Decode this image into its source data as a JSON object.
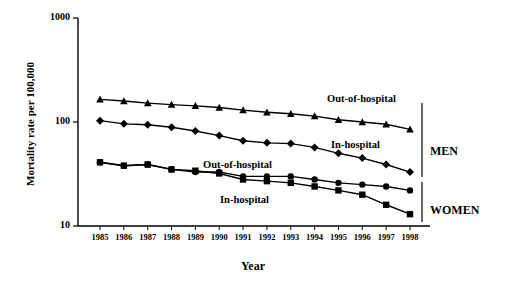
{
  "chart_data": {
    "type": "line",
    "title": "",
    "xlabel": "Year",
    "ylabel": "Mortality rate per 100,000",
    "yscale": "log",
    "ylim": [
      10,
      1000
    ],
    "ytick_labels": [
      "1000",
      "100",
      "10"
    ],
    "ytick_values": [
      1000,
      100,
      10
    ],
    "grid": false,
    "legend_position": "inline-annotations",
    "categories": [
      "1985",
      "1986",
      "1987",
      "1988",
      "1989",
      "1990",
      "1991",
      "1992",
      "1993",
      "1994",
      "1995",
      "1996",
      "1997",
      "1998"
    ],
    "series": [
      {
        "name": "Out-of-hospital",
        "group": "MEN",
        "marker": "triangle",
        "values": [
          165,
          159,
          152,
          147,
          143,
          138,
          130,
          124,
          120,
          114,
          105,
          100,
          95,
          85
        ]
      },
      {
        "name": "In-hospital",
        "group": "MEN",
        "marker": "diamond",
        "values": [
          103,
          96,
          94,
          89,
          82,
          74,
          66,
          63,
          62,
          57,
          50,
          45,
          39,
          33
        ]
      },
      {
        "name": "Out-of-hospital",
        "group": "WOMEN",
        "marker": "circle",
        "values": [
          41,
          38,
          39,
          35,
          33,
          33,
          30,
          30,
          30,
          28,
          26,
          25,
          24,
          22
        ]
      },
      {
        "name": "In-hospital",
        "group": "WOMEN",
        "marker": "square",
        "values": [
          41,
          38,
          39,
          35,
          34,
          32,
          28,
          27,
          26,
          24,
          22,
          20,
          16,
          13
        ]
      }
    ],
    "annotations": [
      {
        "text": "Out-of-hospital",
        "series": "MEN Out-of-hospital"
      },
      {
        "text": "In-hospital",
        "series": "MEN In-hospital"
      },
      {
        "text": "Out-of-hospital",
        "series": "WOMEN Out-of-hospital"
      },
      {
        "text": "In-hospital",
        "series": "WOMEN In-hospital"
      },
      {
        "text": "MEN",
        "type": "group-bracket"
      },
      {
        "text": "WOMEN",
        "type": "group-bracket"
      }
    ],
    "colors": {
      "line": "#000000",
      "marker": "#000000",
      "axis": "#000000",
      "background": "#ffffff"
    }
  },
  "labels": {
    "ylabel": "Mortality rate per 100,000",
    "xlabel": "Year",
    "y_ticks": [
      "1000",
      "100",
      "10"
    ],
    "x_ticks": [
      "1985",
      "1986",
      "1987",
      "1988",
      "1989",
      "1990",
      "1991",
      "1992",
      "1993",
      "1994",
      "1995",
      "1996",
      "1997",
      "1998"
    ],
    "men_out": "Out-of-hospital",
    "men_in": "In-hospital",
    "women_out": "Out-of-hospital",
    "women_in": "In-hospital",
    "group_men": "MEN",
    "group_women": "WOMEN"
  }
}
